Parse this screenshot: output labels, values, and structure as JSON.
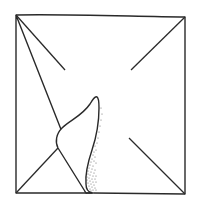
{
  "diagram": {
    "type": "fold-illustration",
    "colors": {
      "background": "#ffffff",
      "stroke": "#2a2a2a",
      "stipple": "#555555"
    },
    "square": {
      "corners": [
        [
          16,
          15
        ],
        [
          185,
          17
        ],
        [
          185,
          194
        ],
        [
          16,
          193
        ]
      ]
    },
    "creases": [
      {
        "name": "top-left",
        "from": [
          16,
          15
        ],
        "to": [
          65,
          70
        ]
      },
      {
        "name": "top-right",
        "from": [
          185,
          17
        ],
        "to": [
          131,
          70
        ]
      },
      {
        "name": "bottom-right",
        "from": [
          185,
          194
        ],
        "to": [
          129,
          138
        ]
      },
      {
        "name": "bottom-left",
        "from": [
          16,
          193
        ],
        "to": [
          58,
          148
        ]
      }
    ],
    "flap": {
      "tip": [
        97,
        97
      ],
      "base_left": [
        58,
        148
      ],
      "base_right": [
        87,
        193
      ]
    }
  }
}
